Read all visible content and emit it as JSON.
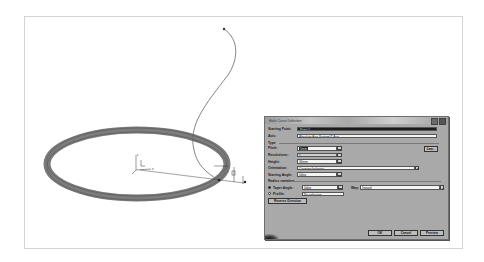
{
  "dialog": {
    "title": "Helix Curve Definition",
    "starting_point": {
      "label": "Starting Point:",
      "value": "Point.1"
    },
    "axis": {
      "label": "Axis:",
      "value": "Absolute Axis System\\Z Axis"
    },
    "type_label": "Type",
    "pitch": {
      "label": "Pitch:",
      "value": "5mm",
      "law_button": "Law..."
    },
    "revolutions": {
      "label": "Revolutions:",
      "value": "1"
    },
    "height": {
      "label": "Height:",
      "value": "36mm"
    },
    "orientation": {
      "label": "Orientation:",
      "value": "Counterclockwise"
    },
    "starting_angle": {
      "label": "Starting Angle:",
      "value": "0deg"
    },
    "radius_variation_label": "Radius variation",
    "taper_angle": {
      "label": "Taper Angle:",
      "value": "0deg",
      "selected": true
    },
    "way": {
      "label": "Way:",
      "value": "Inward"
    },
    "profile": {
      "label": "Profile:",
      "value": "No selection",
      "selected": false
    },
    "reverse_direction_button": "Reverse Direction",
    "buttons": {
      "ok": "OK",
      "cancel": "Cancel",
      "preview": "Preview"
    }
  },
  "viewport": {
    "axis_labels": {
      "x": "x",
      "y": "y",
      "z": "z"
    }
  }
}
